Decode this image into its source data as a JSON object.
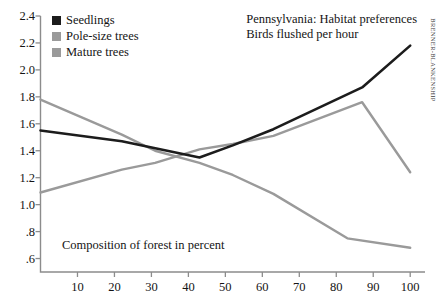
{
  "chart_data": {
    "type": "line",
    "title": "Pennsylvania: Habitat preferences",
    "subtitle": "Birds flushed per hour",
    "caption": "Composition of forest in percent",
    "credit": "BRENNER-BLANKENSHIP",
    "xlabel": "",
    "ylabel": "",
    "xlim": [
      0,
      104
    ],
    "ylim": [
      0.5,
      2.4
    ],
    "grid": false,
    "legend_position": "top-left",
    "xticks": [
      10,
      20,
      30,
      40,
      50,
      60,
      70,
      80,
      90,
      100
    ],
    "xtick_labels": [
      "10",
      "20",
      "30",
      "40",
      "50",
      "60",
      "70",
      "80",
      "90",
      "100"
    ],
    "yticks": [
      0.6,
      0.8,
      1.0,
      1.2,
      1.4,
      1.6,
      1.8,
      2.0,
      2.2,
      2.4
    ],
    "ytick_labels": [
      ".6",
      ".8",
      "1.0",
      "1.2",
      "1.4",
      "1.6",
      "1.8",
      "2.0",
      "2.2",
      "2.4"
    ],
    "series": [
      {
        "name": "Seedlings",
        "color": "#1c1c1c",
        "width": 2.6,
        "x": [
          0,
          22,
          43,
          52,
          63,
          87,
          100
        ],
        "values": [
          1.55,
          1.47,
          1.35,
          1.44,
          1.56,
          1.87,
          2.18
        ]
      },
      {
        "name": "Pole-size trees",
        "color": "#9a9a9a",
        "width": 2.4,
        "x": [
          0,
          22,
          31,
          43,
          52,
          63,
          87,
          100
        ],
        "values": [
          1.09,
          1.26,
          1.31,
          1.41,
          1.45,
          1.51,
          1.76,
          1.24
        ]
      },
      {
        "name": "Mature trees",
        "color": "#9a9a9a",
        "width": 2.4,
        "x": [
          0,
          22,
          31,
          43,
          52,
          63,
          83,
          100
        ],
        "values": [
          1.78,
          1.52,
          1.4,
          1.31,
          1.22,
          1.08,
          0.75,
          0.68
        ]
      }
    ]
  },
  "legend": {
    "items": [
      {
        "label": "Seedlings",
        "color": "#1c1c1c"
      },
      {
        "label": "Pole-size trees",
        "color": "#9a9a9a"
      },
      {
        "label": "Mature trees",
        "color": "#9a9a9a"
      }
    ]
  },
  "axis": {
    "color": "#8c8c8c"
  }
}
